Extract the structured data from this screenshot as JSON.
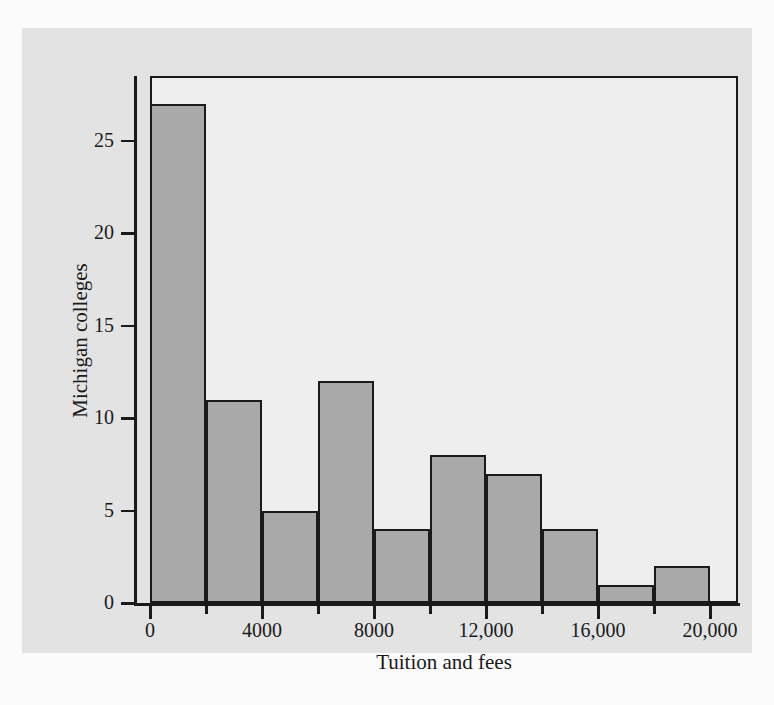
{
  "chart_data": {
    "type": "bar",
    "title": "",
    "subtitle": "",
    "xlabel": "Tuition and fees",
    "ylabel": "Michigan colleges",
    "bin_width": 2000,
    "bin_starts": [
      0,
      2000,
      4000,
      6000,
      8000,
      10000,
      12000,
      14000,
      16000,
      18000
    ],
    "bin_ends": [
      2000,
      4000,
      6000,
      8000,
      10000,
      12000,
      14000,
      16000,
      18000,
      20000
    ],
    "categories": [
      "0-2000",
      "2000-4000",
      "4000-6000",
      "6000-8000",
      "8000-10,000",
      "10,000-12,000",
      "12,000-14,000",
      "14,000-16,000",
      "16,000-18,000",
      "18,000-20,000"
    ],
    "values": [
      27,
      11,
      5,
      12,
      4,
      8,
      7,
      4,
      1,
      2
    ],
    "xlim": [
      0,
      21000
    ],
    "ylim": [
      0,
      28.5
    ],
    "grid": false,
    "legend": null,
    "x_ticks_major": [
      0,
      4000,
      8000,
      12000,
      16000,
      20000
    ],
    "x_tick_labels": [
      "0",
      "4000",
      "8000",
      "12,000",
      "16,000",
      "20,000"
    ],
    "x_ticks_minor": [
      2000,
      6000,
      10000,
      14000,
      18000
    ],
    "y_ticks": [
      0,
      5,
      10,
      15,
      20,
      25
    ],
    "y_tick_labels": [
      "0",
      "5",
      "10",
      "15",
      "20",
      "25"
    ],
    "colors": {
      "bar_fill": "#a9a9a9",
      "bar_edge": "#1a1a1a",
      "plot_background": "#eeeeee",
      "panel_background": "#e3e3e3",
      "page_background": "#fbfbfb",
      "axis": "#1a1a1a",
      "text": "#1a1a1a"
    }
  }
}
